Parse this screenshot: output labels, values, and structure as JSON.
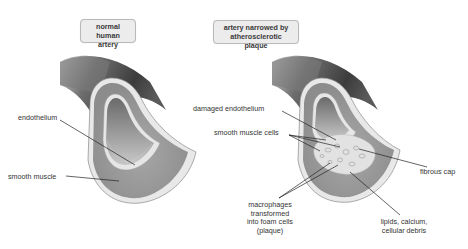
{
  "diagram": {
    "panels": [
      {
        "id": "normal",
        "title_line1": "normal human",
        "title_line2": "artery",
        "labels": {
          "endothelium": "endothelium",
          "smooth_muscle": "smooth muscle"
        }
      },
      {
        "id": "narrowed",
        "title_line1": "artery narrowed by",
        "title_line2": "atherosclerotic plaque",
        "labels": {
          "damaged_endothelium": "damaged  endothelium",
          "smooth_muscle_cells": "smooth muscle cells",
          "fibrous_cap": "fibrous cap",
          "macrophages_l1": "macrophages",
          "macrophages_l2": "transformed",
          "macrophages_l3": "into foam cells",
          "macrophages_l4": "(plaque)",
          "lipids_l1": "lipids, calcium,",
          "lipids_l2": "cellular debris"
        }
      }
    ],
    "colors": {
      "vessel_outer_dark": "#4a4a4a",
      "vessel_outer_light": "#bdbdbd",
      "wall_band": "#d9d9d9",
      "muscle": "#9a9a9a",
      "lumen": "#b5b5b5",
      "plaque": "#e4e4e4",
      "leader_line": "#222222",
      "title_bg": "#ececec"
    }
  }
}
